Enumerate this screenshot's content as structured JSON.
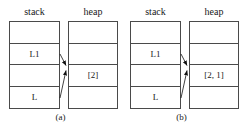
{
  "figure": {
    "panels": [
      {
        "caption": "(a)",
        "stack": {
          "header": "stack",
          "cells": [
            "",
            "L1",
            "",
            "L"
          ]
        },
        "heap": {
          "header": "heap",
          "cells": [
            "",
            "",
            "[2]",
            ""
          ]
        },
        "arrows": [
          {
            "name": "arrow-l1-to-heap"
          },
          {
            "name": "arrow-l-to-heap"
          }
        ]
      },
      {
        "caption": "(b)",
        "stack": {
          "header": "stack",
          "cells": [
            "",
            "L1",
            "",
            "L"
          ]
        },
        "heap": {
          "header": "heap",
          "cells": [
            "",
            "",
            "[2, 1]",
            ""
          ]
        },
        "arrows": [
          {
            "name": "arrow-l1-to-heap"
          },
          {
            "name": "arrow-l-to-heap"
          }
        ]
      }
    ],
    "colors": {
      "background": "#ffffff",
      "stroke": "#4a4a4a",
      "text": "#202020",
      "arrow": "#111111"
    }
  }
}
